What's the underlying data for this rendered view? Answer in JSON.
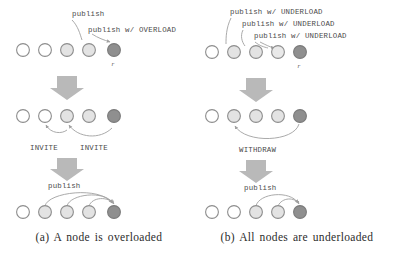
{
  "figure": {
    "width": 396,
    "height": 256,
    "background": "#ffffff"
  },
  "colors": {
    "node_stroke": "#8d8d8d",
    "node_empty": "#ffffff",
    "node_light": "#e3e3e3",
    "node_mid": "#d2d2d2",
    "node_dark": "#8f8f8f",
    "arrow_block": "#b9b9b9",
    "arc": "#a0a0a0",
    "label_text": "#4a4a4a",
    "caption_text": "#2b2b2b"
  },
  "panels": [
    {
      "id": "a",
      "caption": "(a) A node is overloaded",
      "rows": [
        {
          "id": "a-row-1",
          "nodes": [
            {
              "fill": "empty"
            },
            {
              "fill": "empty"
            },
            {
              "fill": "light"
            },
            {
              "fill": "light"
            },
            {
              "fill": "dark",
              "letter": "r"
            }
          ],
          "labels": [
            "publish",
            "publish w/ OVERLOAD"
          ],
          "arcs": 2
        },
        {
          "id": "a-row-2",
          "nodes": [
            {
              "fill": "empty"
            },
            {
              "fill": "empty"
            },
            {
              "fill": "light"
            },
            {
              "fill": "light"
            },
            {
              "fill": "dark"
            }
          ],
          "labels": [
            "INVITE",
            "INVITE"
          ],
          "arcs": 2
        },
        {
          "id": "a-row-3",
          "nodes": [
            {
              "fill": "empty"
            },
            {
              "fill": "light"
            },
            {
              "fill": "light"
            },
            {
              "fill": "light"
            },
            {
              "fill": "dark"
            }
          ],
          "labels": [
            "publish"
          ],
          "arcs": 3
        }
      ]
    },
    {
      "id": "b",
      "caption": "(b) All nodes are underloaded",
      "rows": [
        {
          "id": "b-row-1",
          "nodes": [
            {
              "fill": "empty"
            },
            {
              "fill": "light"
            },
            {
              "fill": "light"
            },
            {
              "fill": "empty"
            },
            {
              "fill": "dark",
              "letter": "r"
            }
          ],
          "labels": [
            "publish w/ UNDERLOAD",
            "publish w/ UNDERLOAD",
            "publish w/ UNDERLOAD"
          ],
          "arcs": 3
        },
        {
          "id": "b-row-2",
          "nodes": [
            {
              "fill": "empty"
            },
            {
              "fill": "light"
            },
            {
              "fill": "light"
            },
            {
              "fill": "light"
            },
            {
              "fill": "dark"
            }
          ],
          "labels": [
            "WITHDRAW"
          ],
          "arcs": 1
        },
        {
          "id": "b-row-3",
          "nodes": [
            {
              "fill": "empty"
            },
            {
              "fill": "empty"
            },
            {
              "fill": "light"
            },
            {
              "fill": "light"
            },
            {
              "fill": "dark"
            }
          ],
          "labels": [
            "publish"
          ],
          "arcs": 2
        }
      ]
    }
  ],
  "text": {
    "publish": "publish",
    "publish_overload": "publish w/ OVERLOAD",
    "publish_underload": "publish w/ UNDERLOAD",
    "invite": "INVITE",
    "withdraw": "WITHDRAW",
    "node_label_r": "r",
    "caption_a": "(a) A node is overloaded",
    "caption_b": "(b) All nodes are underloaded"
  }
}
